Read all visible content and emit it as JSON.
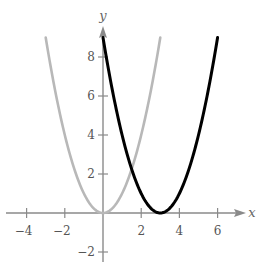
{
  "chart_data": {
    "type": "line",
    "title": "",
    "xlabel": "x",
    "ylabel": "y",
    "xlim": [
      -5,
      7
    ],
    "ylim": [
      -3,
      9.5
    ],
    "x_ticks": [
      -4,
      -2,
      2,
      4,
      6
    ],
    "y_ticks": [
      -2,
      2,
      4,
      6,
      8
    ],
    "x_tick_labels": [
      "−4",
      "−2",
      "2",
      "4",
      "6"
    ],
    "y_tick_labels": [
      "−2",
      "2",
      "4",
      "6",
      "8"
    ],
    "grid": false,
    "legend": null,
    "series": [
      {
        "name": "y = x^2",
        "color": "#b8b8b8",
        "x": [
          -3,
          -2,
          -1,
          0,
          1,
          2,
          3
        ],
        "y": [
          9,
          4,
          1,
          0,
          1,
          4,
          9
        ]
      },
      {
        "name": "y = (x - 3)^2",
        "color": "#000000",
        "x": [
          0,
          1,
          2,
          3,
          4,
          5,
          6
        ],
        "y": [
          9,
          4,
          1,
          0,
          1,
          4,
          9
        ]
      }
    ]
  }
}
